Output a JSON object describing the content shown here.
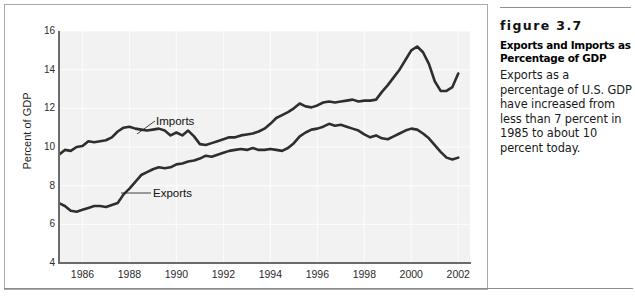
{
  "figure": {
    "number_label": "figure 3.7",
    "title": "Exports and Imports as Percentage of GDP",
    "body": "Exports as a percentage of U.S. GDP have increased from less than 7 percent in 1985 to about 10 percent today."
  },
  "chart_data": {
    "type": "line",
    "title": "",
    "xlabel": "",
    "ylabel": "Percent of GDP",
    "xlim": [
      1985.0,
      2002.5
    ],
    "ylim": [
      4,
      16
    ],
    "yticks": [
      4,
      6,
      8,
      10,
      12,
      14,
      16
    ],
    "xticks": [
      1986,
      1988,
      1990,
      1992,
      1994,
      1996,
      1998,
      2000,
      2002
    ],
    "grid": true,
    "legend_position": "inline-annotations",
    "line_color": "#2e2e2e",
    "plot_background": "#f2f2f2",
    "annotations": [
      {
        "text": "Imports",
        "x": 1989.4,
        "y": 11.55
      },
      {
        "text": "Exports",
        "x": 1989.2,
        "y": 8.15
      }
    ],
    "x": [
      1985.0,
      1985.25,
      1985.5,
      1985.75,
      1986.0,
      1986.25,
      1986.5,
      1986.75,
      1987.0,
      1987.25,
      1987.5,
      1987.75,
      1988.0,
      1988.25,
      1988.5,
      1988.75,
      1989.0,
      1989.25,
      1989.5,
      1989.75,
      1990.0,
      1990.25,
      1990.5,
      1990.75,
      1991.0,
      1991.25,
      1991.5,
      1991.75,
      1992.0,
      1992.25,
      1992.5,
      1992.75,
      1993.0,
      1993.25,
      1993.5,
      1993.75,
      1994.0,
      1994.25,
      1994.5,
      1994.75,
      1995.0,
      1995.25,
      1995.5,
      1995.75,
      1996.0,
      1996.25,
      1996.5,
      1996.75,
      1997.0,
      1997.25,
      1997.5,
      1997.75,
      1998.0,
      1998.25,
      1998.5,
      1998.75,
      1999.0,
      1999.25,
      1999.5,
      1999.75,
      2000.0,
      2000.25,
      2000.5,
      2000.75,
      2001.0,
      2001.25,
      2001.5,
      2001.75,
      2002.0
    ],
    "series": [
      {
        "name": "Imports",
        "values": [
          9.6,
          9.85,
          9.8,
          10.0,
          10.05,
          10.3,
          10.25,
          10.3,
          10.35,
          10.5,
          10.8,
          11.0,
          11.05,
          10.95,
          10.9,
          10.85,
          10.9,
          10.95,
          10.85,
          10.6,
          10.75,
          10.6,
          10.85,
          10.55,
          10.15,
          10.1,
          10.2,
          10.3,
          10.4,
          10.5,
          10.5,
          10.6,
          10.65,
          10.7,
          10.8,
          10.95,
          11.2,
          11.5,
          11.65,
          11.8,
          12.0,
          12.25,
          12.1,
          12.05,
          12.15,
          12.3,
          12.35,
          12.3,
          12.35,
          12.4,
          12.45,
          12.35,
          12.4,
          12.4,
          12.45,
          12.85,
          13.2,
          13.6,
          14.0,
          14.5,
          15.0,
          15.2,
          14.9,
          14.3,
          13.4,
          12.9,
          12.9,
          13.1,
          13.8
        ]
      },
      {
        "name": "Exports",
        "values": [
          7.1,
          6.95,
          6.7,
          6.65,
          6.75,
          6.85,
          6.95,
          6.95,
          6.9,
          7.0,
          7.1,
          7.55,
          7.85,
          8.2,
          8.55,
          8.7,
          8.85,
          8.95,
          8.9,
          8.95,
          9.1,
          9.15,
          9.25,
          9.3,
          9.4,
          9.55,
          9.5,
          9.6,
          9.7,
          9.8,
          9.85,
          9.9,
          9.85,
          9.95,
          9.85,
          9.85,
          9.9,
          9.85,
          9.8,
          9.95,
          10.2,
          10.55,
          10.75,
          10.9,
          10.95,
          11.05,
          11.2,
          11.1,
          11.15,
          11.05,
          10.95,
          10.85,
          10.65,
          10.5,
          10.6,
          10.45,
          10.4,
          10.55,
          10.7,
          10.85,
          10.95,
          10.9,
          10.7,
          10.45,
          10.1,
          9.75,
          9.45,
          9.35,
          9.45
        ]
      }
    ]
  }
}
